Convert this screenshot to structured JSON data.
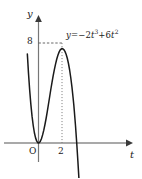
{
  "figure": {
    "background_color": "#ffffff",
    "ink_color": "#1a1a1a",
    "axis_color": "#555555",
    "guide_color": "#777777",
    "width": 142,
    "height": 178
  },
  "axes": {
    "y_axis_label": "y",
    "x_axis_label": "t",
    "origin_label": "O",
    "y_tick_label": "8",
    "x_tick_label": "2"
  },
  "equation": {
    "lhs": "y",
    "equals": "=",
    "term1_sign": "−",
    "term1_coeff": "2",
    "term1_var": "t",
    "term1_exp": "3",
    "term2_sign": "+",
    "term2_coeff": "6",
    "term2_var": "t",
    "term2_exp": "2",
    "full_text": "y = −2t³ + 6t²"
  },
  "chart_data": {
    "type": "line",
    "title": "",
    "xlabel": "t",
    "ylabel": "y",
    "function": "y = -2t^3 + 6t^2",
    "grid": false,
    "legend": "none",
    "xlim": [
      -1.1,
      4.2
    ],
    "ylim": [
      -8.5,
      11.5
    ],
    "xticks": [
      0,
      2
    ],
    "xtick_labels": [
      "O",
      "2"
    ],
    "yticks": [
      8
    ],
    "ytick_labels": [
      "8"
    ],
    "annotations": [
      {
        "kind": "dashed-horizontal-guide",
        "from": [
          0,
          8
        ],
        "to": [
          2,
          8
        ],
        "label": "8"
      },
      {
        "kind": "dotted-vertical-guide",
        "from": [
          2,
          8
        ],
        "to": [
          2,
          0
        ],
        "label": "2"
      },
      {
        "kind": "equation-label",
        "at": [
          2.45,
          8.6
        ],
        "text": "y = −2t³ + 6t²"
      }
    ],
    "key_points": [
      {
        "name": "origin-double-root",
        "x": 0,
        "y": 0
      },
      {
        "name": "local-maximum",
        "x": 2,
        "y": 8
      },
      {
        "name": "right-root",
        "x": 3,
        "y": 0
      }
    ],
    "series": [
      {
        "name": "y = -2t^3 + 6t^2",
        "x": [
          -0.95,
          -0.85,
          -0.75,
          -0.65,
          -0.55,
          -0.45,
          -0.35,
          -0.25,
          -0.15,
          -0.05,
          0.0,
          0.05,
          0.15,
          0.25,
          0.35,
          0.45,
          0.55,
          0.65,
          0.75,
          0.85,
          0.95,
          1.05,
          1.15,
          1.25,
          1.35,
          1.45,
          1.55,
          1.65,
          1.75,
          1.85,
          1.95,
          2.0,
          2.05,
          2.15,
          2.25,
          2.35,
          2.45,
          2.55,
          2.65,
          2.75,
          2.85,
          2.95,
          3.0,
          3.05,
          3.15,
          3.25,
          3.35,
          3.45,
          3.55
        ],
        "y": [
          7.13,
          5.56,
          4.22,
          3.09,
          2.15,
          1.4,
          0.82,
          0.41,
          0.15,
          0.015,
          0.0,
          0.0145,
          0.128,
          0.344,
          0.65,
          1.03,
          1.48,
          1.98,
          2.53,
          3.12,
          3.7,
          4.3,
          4.85,
          5.39,
          5.87,
          6.31,
          6.7,
          7.02,
          7.27,
          7.45,
          7.53,
          7.56,
          7.55,
          7.48,
          7.33,
          7.1,
          6.78,
          6.36,
          5.84,
          5.2,
          4.45,
          3.56,
          3.1,
          2.54,
          1.38,
          0.04,
          -1.42,
          -3.0,
          -4.74
        ]
      }
    ]
  }
}
